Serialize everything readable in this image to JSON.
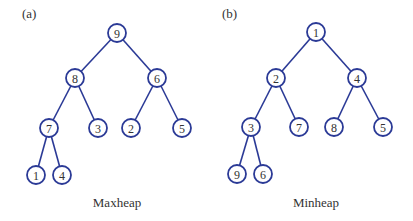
{
  "colors": {
    "stroke": "#2b3a96",
    "text": "#333333",
    "background": "#ffffff"
  },
  "node_radius": 9,
  "panels": [
    {
      "label": "(a)",
      "label_pos": [
        22,
        18
      ],
      "caption": "Maxheap",
      "caption_pos": [
        117,
        207
      ],
      "nodes": [
        {
          "id": "a9",
          "value": "9",
          "x": 117,
          "y": 33
        },
        {
          "id": "a8",
          "value": "8",
          "x": 75,
          "y": 78
        },
        {
          "id": "a6",
          "value": "6",
          "x": 157,
          "y": 78
        },
        {
          "id": "a7",
          "value": "7",
          "x": 49,
          "y": 128
        },
        {
          "id": "a3",
          "value": "3",
          "x": 98,
          "y": 128
        },
        {
          "id": "a2",
          "value": "2",
          "x": 131,
          "y": 128
        },
        {
          "id": "a5",
          "value": "5",
          "x": 182,
          "y": 128
        },
        {
          "id": "a1",
          "value": "1",
          "x": 36,
          "y": 175
        },
        {
          "id": "a4",
          "value": "4",
          "x": 62,
          "y": 175
        }
      ],
      "edges": [
        [
          "a9",
          "a8"
        ],
        [
          "a9",
          "a6"
        ],
        [
          "a8",
          "a7"
        ],
        [
          "a8",
          "a3"
        ],
        [
          "a6",
          "a2"
        ],
        [
          "a6",
          "a5"
        ],
        [
          "a7",
          "a1"
        ],
        [
          "a7",
          "a4"
        ]
      ]
    },
    {
      "label": "(b)",
      "label_pos": [
        222,
        18
      ],
      "caption": "Minheap",
      "caption_pos": [
        316,
        207
      ],
      "nodes": [
        {
          "id": "b1",
          "value": "1",
          "x": 316,
          "y": 32
        },
        {
          "id": "b2",
          "value": "2",
          "x": 276,
          "y": 78
        },
        {
          "id": "b4",
          "value": "4",
          "x": 357,
          "y": 78
        },
        {
          "id": "b3",
          "value": "3",
          "x": 251,
          "y": 127
        },
        {
          "id": "b7",
          "value": "7",
          "x": 299,
          "y": 127
        },
        {
          "id": "b8",
          "value": "8",
          "x": 334,
          "y": 127
        },
        {
          "id": "b5",
          "value": "5",
          "x": 383,
          "y": 127
        },
        {
          "id": "b9",
          "value": "9",
          "x": 237,
          "y": 174
        },
        {
          "id": "b6",
          "value": "6",
          "x": 263,
          "y": 174
        }
      ],
      "edges": [
        [
          "b1",
          "b2"
        ],
        [
          "b1",
          "b4"
        ],
        [
          "b2",
          "b3"
        ],
        [
          "b2",
          "b7"
        ],
        [
          "b4",
          "b8"
        ],
        [
          "b4",
          "b5"
        ],
        [
          "b3",
          "b9"
        ],
        [
          "b3",
          "b6"
        ]
      ]
    }
  ]
}
